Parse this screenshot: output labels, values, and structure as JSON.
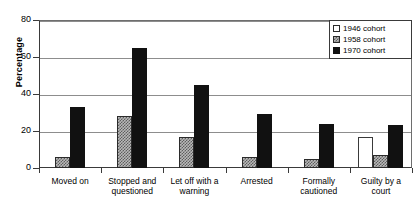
{
  "chart_data": {
    "type": "bar",
    "title": "",
    "xlabel": "",
    "ylabel": "Percentage",
    "ylim": [
      0,
      80
    ],
    "yticks": [
      0,
      20,
      40,
      60,
      80
    ],
    "grid": true,
    "legend_position": "top-right",
    "categories": [
      "Moved on",
      "Stopped and questioned",
      "Let off with a warning",
      "Arrested",
      "Formally cautioned",
      "Guilty by a court"
    ],
    "series": [
      {
        "name": "1946 cohort",
        "color": "#ffffff",
        "values": [
          0,
          0,
          0,
          0,
          0,
          17
        ]
      },
      {
        "name": "1958 cohort",
        "color": "#b9b9b9",
        "values": [
          6,
          28,
          17,
          6,
          5,
          7
        ]
      },
      {
        "name": "1970 cohort",
        "color": "#111111",
        "values": [
          33,
          65,
          45,
          29,
          24,
          23
        ]
      }
    ]
  },
  "legend": {
    "items": [
      {
        "label": "1946 cohort"
      },
      {
        "label": "1958 cohort"
      },
      {
        "label": "1970 cohort"
      }
    ]
  }
}
